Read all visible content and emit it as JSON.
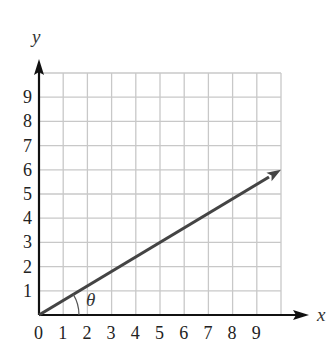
{
  "chart_data": {
    "type": "line",
    "title": "",
    "xlabel": "x",
    "ylabel": "y",
    "xlim": [
      0,
      10
    ],
    "ylim": [
      0,
      10
    ],
    "grid": true,
    "x_ticks": [
      "0",
      "1",
      "2",
      "3",
      "4",
      "5",
      "6",
      "7",
      "8",
      "9"
    ],
    "y_ticks": [
      "1",
      "2",
      "3",
      "4",
      "5",
      "6",
      "7",
      "8",
      "9"
    ],
    "series": [
      {
        "name": "vector",
        "x": [
          0,
          10
        ],
        "y": [
          0,
          6
        ],
        "arrow_head": true,
        "color": "#444444"
      }
    ],
    "annotations": [
      {
        "text": "θ",
        "type": "angle-arc",
        "between": "x-axis and vector",
        "at": [
          0,
          0
        ]
      }
    ]
  },
  "colors": {
    "grid": "#c8c8c8",
    "axis": "#111111",
    "vector": "#444444"
  }
}
